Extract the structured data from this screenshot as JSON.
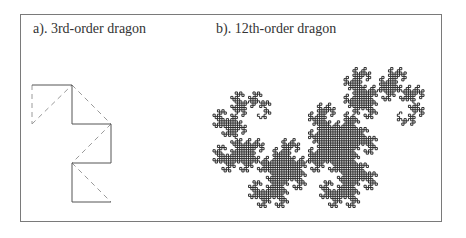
{
  "figure": {
    "panels": [
      {
        "id": "a",
        "label": "a). 3rd-order dragon",
        "order": 3,
        "solid_path": [
          [
            32,
            85
          ],
          [
            72,
            85
          ],
          [
            72,
            124
          ],
          [
            111,
            124
          ],
          [
            111,
            163
          ],
          [
            72,
            163
          ],
          [
            72,
            202
          ],
          [
            111,
            202
          ]
        ],
        "dashed_lines": [
          [
            [
              32,
              85
            ],
            [
              32,
              124
            ]
          ],
          [
            [
              32,
              124
            ],
            [
              72,
              85
            ]
          ],
          [
            [
              72,
              85
            ],
            [
              111,
              124
            ]
          ],
          [
            [
              111,
              124
            ],
            [
              72,
              163
            ]
          ],
          [
            [
              72,
              163
            ],
            [
              111,
              202
            ]
          ]
        ],
        "line_color": "#555555",
        "dash_color": "#9a9a9a"
      },
      {
        "id": "b",
        "label": "b). 12th-order dragon",
        "order": 12,
        "bbox": [
          213,
          63,
          424,
          212
        ],
        "fill_color": "#1a1a1a"
      }
    ],
    "frame_color": "#7a7a7a"
  }
}
